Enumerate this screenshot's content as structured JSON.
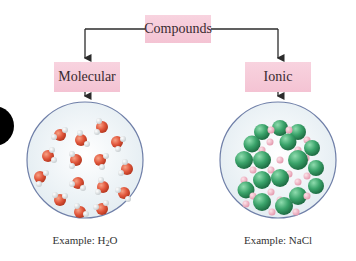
{
  "diagram": {
    "root": {
      "label": "Compounds"
    },
    "branches": [
      {
        "label": "Molecular",
        "example_prefix": "Example: H",
        "example_sub": "2",
        "example_suffix": "O"
      },
      {
        "label": "Ionic",
        "example_prefix": "Example: NaCl",
        "example_sub": "",
        "example_suffix": ""
      }
    ]
  },
  "colors": {
    "box_fill": "#f6c9d8",
    "line": "#2b2b2b",
    "circle_border": "#6f7fa8",
    "circle_fill": "#eef3f6",
    "oxygen": "#e0553a",
    "hydrogen": "#f2f2f2",
    "chloride": "#3aa36a",
    "sodium": "#f2b8c6"
  }
}
